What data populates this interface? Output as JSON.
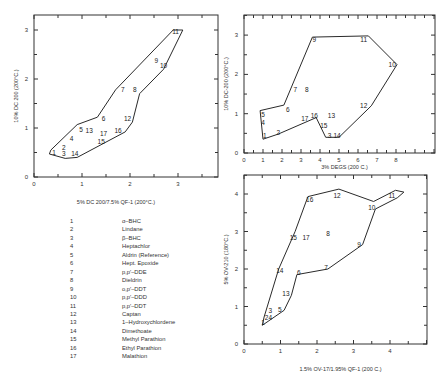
{
  "chart_data": [
    {
      "type": "scatter",
      "id": "plot1",
      "xlabel": "5% DC 200/7.5% QF-1 (200°C.)",
      "ylabel": "10% DC 200 (200°C.)",
      "xlim": [
        0,
        3.8
      ],
      "ylim": [
        0,
        3.3
      ],
      "xticks": [
        0,
        1,
        2,
        3
      ],
      "yticks": [
        0,
        1,
        2,
        3
      ],
      "minor_step": 0.5,
      "frame": {
        "left": 34,
        "top": 15,
        "right": 218,
        "bottom": 177
      },
      "origin": {
        "x": 34,
        "y": 177
      },
      "scale": {
        "x": 48,
        "y": 49
      },
      "points": [
        {
          "label": "1",
          "x": 0.42,
          "y": 0.5
        },
        {
          "label": "2",
          "x": 0.62,
          "y": 0.6
        },
        {
          "label": "3",
          "x": 0.62,
          "y": 0.48
        },
        {
          "label": "4",
          "x": 0.78,
          "y": 0.78
        },
        {
          "label": "5",
          "x": 0.98,
          "y": 0.97
        },
        {
          "label": "6",
          "x": 1.45,
          "y": 1.2
        },
        {
          "label": "7",
          "x": 1.85,
          "y": 1.78
        },
        {
          "label": "8",
          "x": 2.1,
          "y": 1.78
        },
        {
          "label": "9",
          "x": 2.55,
          "y": 2.38
        },
        {
          "label": "10",
          "x": 2.7,
          "y": 2.28
        },
        {
          "label": "11",
          "x": 2.95,
          "y": 2.97
        },
        {
          "label": "12",
          "x": 1.95,
          "y": 1.2
        },
        {
          "label": "13",
          "x": 1.15,
          "y": 0.95
        },
        {
          "label": "14",
          "x": 0.85,
          "y": 0.48
        },
        {
          "label": "15",
          "x": 1.4,
          "y": 0.72
        },
        {
          "label": "16",
          "x": 1.75,
          "y": 0.95
        },
        {
          "label": "17",
          "x": 1.45,
          "y": 0.89
        }
      ],
      "envelope": [
        [
          0.35,
          0.55
        ],
        [
          0.9,
          1.07
        ],
        [
          1.32,
          1.22
        ],
        [
          1.7,
          1.78
        ],
        [
          2.9,
          3.0
        ],
        [
          3.1,
          3.0
        ],
        [
          2.7,
          2.2
        ],
        [
          2.2,
          1.7
        ],
        [
          2.05,
          1.12
        ],
        [
          1.9,
          0.92
        ],
        [
          0.9,
          0.4
        ],
        [
          0.65,
          0.38
        ],
        [
          0.32,
          0.47
        ],
        [
          0.35,
          0.55
        ]
      ]
    },
    {
      "type": "scatter",
      "id": "plot2",
      "xlabel": "3% DEGS (200 C.)",
      "ylabel": "10% DC-200 (200°C.)",
      "xlim": [
        0,
        10
      ],
      "ylim": [
        0,
        3.5
      ],
      "xticks": [
        0,
        1,
        2,
        3,
        4,
        5,
        6,
        7,
        8
      ],
      "yticks": [
        0,
        1,
        2,
        3
      ],
      "minor_step": 0.5,
      "frame": {
        "left": 244,
        "top": 15,
        "right": 435,
        "bottom": 153
      },
      "origin": {
        "x": 244,
        "y": 153
      },
      "scale": {
        "x": 19,
        "y": 39.3
      },
      "points": [
        {
          "label": "1",
          "x": 1.1,
          "y": 0.45
        },
        {
          "label": "2",
          "x": 1.8,
          "y": 0.52
        },
        {
          "label": "3",
          "x": 4.5,
          "y": 0.45
        },
        {
          "label": "4",
          "x": 1.0,
          "y": 0.78
        },
        {
          "label": "5",
          "x": 1.0,
          "y": 0.98
        },
        {
          "label": "6",
          "x": 2.3,
          "y": 1.1
        },
        {
          "label": "7",
          "x": 2.7,
          "y": 1.62
        },
        {
          "label": "8",
          "x": 3.3,
          "y": 1.62
        },
        {
          "label": "9",
          "x": 3.7,
          "y": 2.88
        },
        {
          "label": "10",
          "x": 7.8,
          "y": 2.25
        },
        {
          "label": "11",
          "x": 6.3,
          "y": 2.9
        },
        {
          "label": "12",
          "x": 6.3,
          "y": 1.22
        },
        {
          "label": "13",
          "x": 4.6,
          "y": 0.95
        },
        {
          "label": "14",
          "x": 4.9,
          "y": 0.45
        },
        {
          "label": "15",
          "x": 4.2,
          "y": 0.7
        },
        {
          "label": "16",
          "x": 3.7,
          "y": 0.95
        },
        {
          "label": "17",
          "x": 3.2,
          "y": 0.88
        }
      ],
      "envelope": [
        [
          1.0,
          0.35
        ],
        [
          0.85,
          1.08
        ],
        [
          2.1,
          1.22
        ],
        [
          3.6,
          2.95
        ],
        [
          6.55,
          2.98
        ],
        [
          8.05,
          2.25
        ],
        [
          6.7,
          1.2
        ],
        [
          5.0,
          0.4
        ],
        [
          4.3,
          0.4
        ],
        [
          3.8,
          0.9
        ],
        [
          1.8,
          0.48
        ],
        [
          1.0,
          0.35
        ]
      ]
    },
    {
      "type": "scatter",
      "id": "plot3",
      "xlabel": "1.5% OV-17/1.95% QF-1 (200 C.)",
      "ylabel": "5% OV-210 (180°C.)",
      "xlim": [
        0,
        5
      ],
      "ylim": [
        0,
        4.5
      ],
      "xticks": [
        0,
        1,
        2,
        3,
        4
      ],
      "yticks": [
        0,
        1,
        2,
        3,
        4
      ],
      "minor_step": 0.5,
      "frame": {
        "left": 244,
        "top": 175,
        "right": 427,
        "bottom": 344
      },
      "origin": {
        "x": 244,
        "y": 344
      },
      "scale": {
        "x": 36.5,
        "y": 37.5
      },
      "points": [
        {
          "label": "1",
          "x": 0.52,
          "y": 0.58
        },
        {
          "label": "2",
          "x": 0.62,
          "y": 0.72
        },
        {
          "label": "3",
          "x": 0.72,
          "y": 0.9
        },
        {
          "label": "4",
          "x": 0.72,
          "y": 0.72
        },
        {
          "label": "5",
          "x": 0.98,
          "y": 0.92
        },
        {
          "label": "6",
          "x": 1.5,
          "y": 1.9
        },
        {
          "label": "7",
          "x": 2.25,
          "y": 2.05
        },
        {
          "label": "8",
          "x": 2.3,
          "y": 2.95
        },
        {
          "label": "9",
          "x": 3.15,
          "y": 2.65
        },
        {
          "label": "10",
          "x": 3.5,
          "y": 3.65
        },
        {
          "label": "11",
          "x": 4.05,
          "y": 3.97
        },
        {
          "label": "12",
          "x": 2.55,
          "y": 3.97
        },
        {
          "label": "13",
          "x": 1.15,
          "y": 1.35
        },
        {
          "label": "14",
          "x": 0.98,
          "y": 1.95
        },
        {
          "label": "15",
          "x": 1.35,
          "y": 2.85
        },
        {
          "label": "16",
          "x": 1.8,
          "y": 3.85
        },
        {
          "label": "17",
          "x": 1.7,
          "y": 2.85
        }
      ],
      "envelope": [
        [
          0.5,
          0.5
        ],
        [
          0.55,
          0.72
        ],
        [
          0.95,
          2.0
        ],
        [
          1.4,
          3.0
        ],
        [
          1.75,
          3.93
        ],
        [
          2.6,
          4.13
        ],
        [
          3.55,
          3.8
        ],
        [
          4.15,
          4.1
        ],
        [
          4.38,
          4.05
        ],
        [
          4.2,
          3.9
        ],
        [
          3.6,
          3.6
        ],
        [
          3.25,
          2.65
        ],
        [
          2.3,
          2.0
        ],
        [
          1.45,
          1.85
        ],
        [
          1.3,
          1.3
        ],
        [
          1.1,
          0.9
        ],
        [
          0.5,
          0.5
        ]
      ]
    }
  ],
  "legend": {
    "items": [
      {
        "num": "1",
        "name": "α–BHC"
      },
      {
        "num": "2",
        "name": "Lindane"
      },
      {
        "num": "3",
        "name": "β–BHC"
      },
      {
        "num": "4",
        "name": "Heptachlor"
      },
      {
        "num": "5",
        "name": "Aldrin (Reference)"
      },
      {
        "num": "6",
        "name": "Hept. Epoxide"
      },
      {
        "num": "7",
        "name": "p,p′–DDE"
      },
      {
        "num": "8",
        "name": "Dieldrin"
      },
      {
        "num": "9",
        "name": "o,p′–DDT"
      },
      {
        "num": "10",
        "name": "p,p′–DDD"
      },
      {
        "num": "11",
        "name": "p,p′–DDT"
      },
      {
        "num": "12",
        "name": "Captan"
      },
      {
        "num": "13",
        "name": "1–Hydroxychlordene"
      },
      {
        "num": "14",
        "name": "Dimethoate"
      },
      {
        "num": "15",
        "name": "Methyl Parathion"
      },
      {
        "num": "16",
        "name": "Ethyl Parathion"
      },
      {
        "num": "17",
        "name": "Malathion"
      }
    ]
  }
}
